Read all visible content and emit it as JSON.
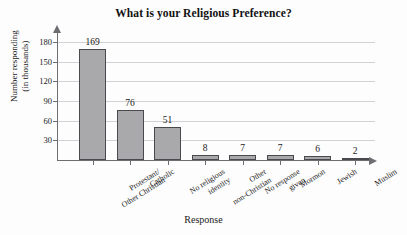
{
  "chart_data": {
    "type": "bar",
    "title": "What is your Religious Preference?",
    "xlabel": "Response",
    "ylabel": "Number responding\n(in thousands)",
    "ylabel_line1": "Number responding",
    "ylabel_line2": "(in thousands)",
    "categories": [
      "Protestant/\nOther Christian",
      "Catholic",
      "No religious\nidentity",
      "Other\nnon-Christian",
      "No response\ngiven",
      "Mormon",
      "Jewish",
      "Muslim"
    ],
    "category_lines": [
      [
        "Protestant/",
        "Other Christian"
      ],
      [
        "Catholic"
      ],
      [
        "No religious",
        "identity"
      ],
      [
        "Other",
        "non-Christian"
      ],
      [
        "No response",
        "given"
      ],
      [
        "Mormon"
      ],
      [
        "Jewish"
      ],
      [
        "Muslim"
      ]
    ],
    "values": [
      169,
      76,
      51,
      8,
      7,
      7,
      6,
      2
    ],
    "value_labels": [
      "169",
      "76",
      "51",
      "8",
      "7",
      "7",
      "6",
      "2"
    ],
    "ylim": [
      0,
      190
    ],
    "yticks": [
      30,
      60,
      90,
      120,
      150,
      180
    ],
    "ytick_labels": [
      "30",
      "60",
      "90",
      "120",
      "150",
      "180"
    ],
    "grid": true,
    "grid_axis": "y",
    "legend": "none",
    "bar_fill_color": "#a9a9ab",
    "bar_border_color": "#4a4a4e",
    "gridline_color": "#d2d2d6",
    "axis_color": "#6d6d72",
    "background_color": "#fdfdfd"
  }
}
